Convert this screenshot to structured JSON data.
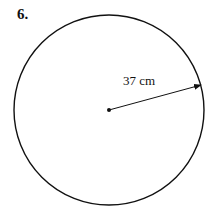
{
  "problem": {
    "number": "6.",
    "radius_label": "37 cm"
  },
  "figure": {
    "shape": "circle",
    "center": [
      109,
      110
    ],
    "radius_px": 95,
    "stroke_color": "#111111",
    "radius_arrow_end": [
      202,
      85
    ]
  }
}
